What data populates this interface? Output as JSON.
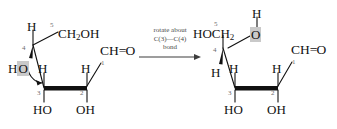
{
  "figure": {
    "type": "chemical-reaction-scheme",
    "background_color": "#ffffff",
    "ink_color": "#111111",
    "highlight_color": "#c9c9c9",
    "locant_color": "#6b6b6b"
  },
  "reaction_arrow": {
    "label_line1": "rotate about",
    "label_line2": "C(3)—C(4)",
    "label_line3": "bond",
    "glyph": "right-arrow"
  },
  "left_structure": {
    "name": "open-chain-sugar-before-rotation",
    "atoms": {
      "c5_label": "CH",
      "c5_sub": "2",
      "c5_tail": "OH",
      "c4_h": "H",
      "c4_ho_h": "H",
      "c4_ho_o": "O",
      "c3_h": "H",
      "c3_oh": "HO",
      "c2_h": "H",
      "c2_oh": "OH",
      "c1_label": "CH",
      "c1_double_bond": "=",
      "c1_o": "O"
    },
    "locants": {
      "n5": "5",
      "n4": "4",
      "n3": "3",
      "n2": "2",
      "n1": "1"
    },
    "curved_arrow": "rotation-curl-arrow"
  },
  "right_structure": {
    "name": "open-chain-sugar-after-rotation",
    "atoms": {
      "oh_top_h": "H",
      "oh_top_o": "O",
      "c5_label": "HOCH",
      "c5_sub": "2",
      "c4_h": "H",
      "c3_h": "H",
      "c3_oh": "HO",
      "c2_h": "H",
      "c2_oh": "OH",
      "c1_label": "CH",
      "c1_double_bond": "=",
      "c1_o": "O"
    },
    "locants": {
      "n5": "5",
      "n4": "4",
      "n3": "3",
      "n2": "2",
      "n1": "1"
    }
  }
}
